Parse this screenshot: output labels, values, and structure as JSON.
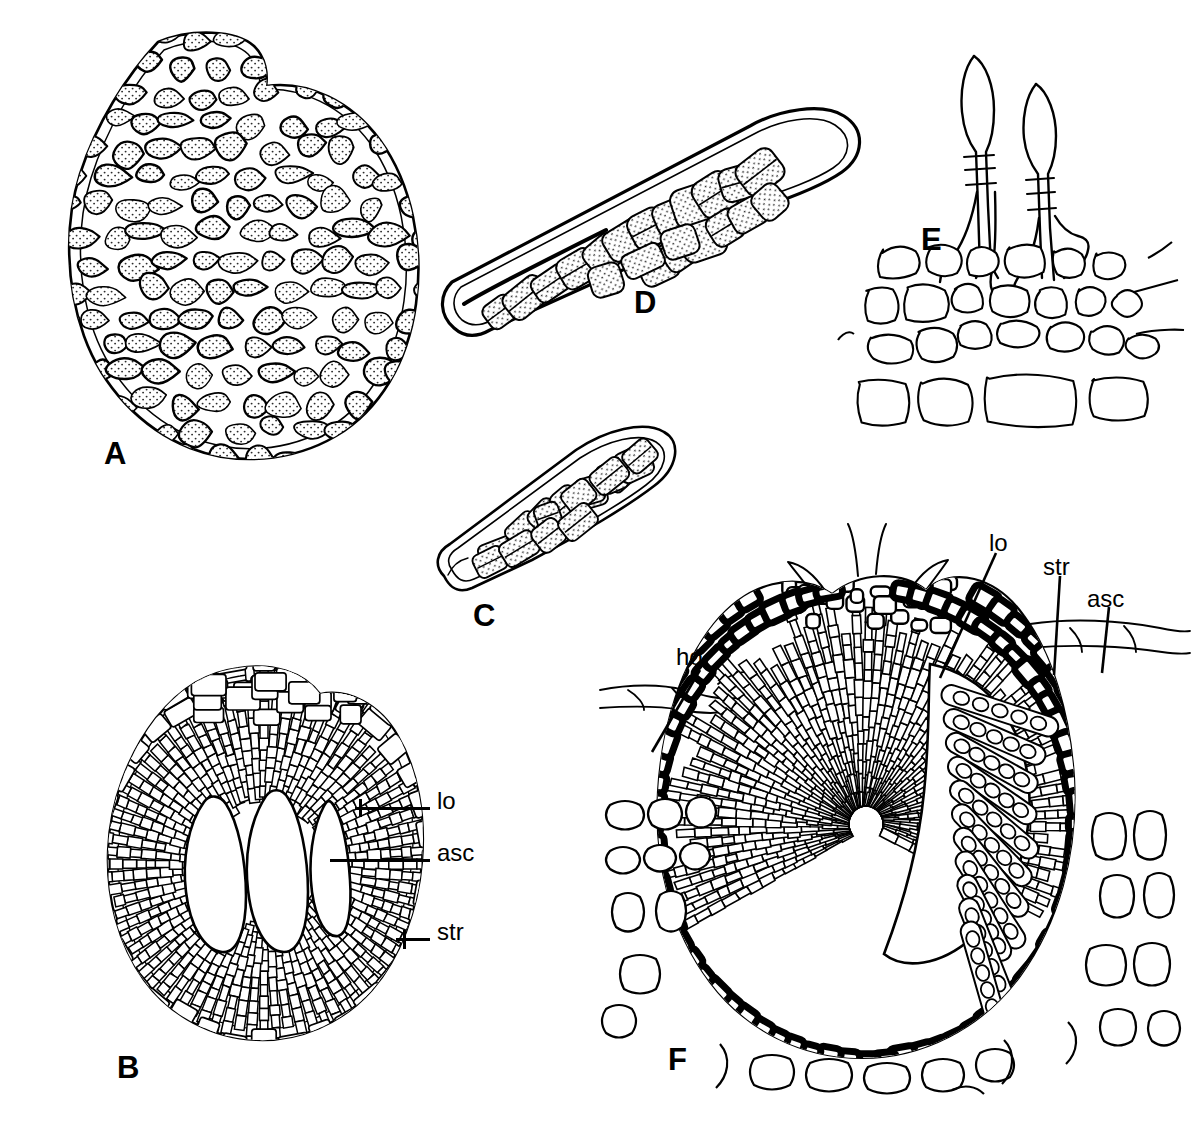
{
  "figure": {
    "kind": "scientific-line-drawing-plate",
    "background_color": "#ffffff",
    "ink_color": "#000000",
    "width": 1198,
    "height": 1132,
    "panel_count": 6
  },
  "panels": [
    {
      "id": "A",
      "letter": "A",
      "description": "Surface view of ascoma showing stippled pseudoparenchymatous cells forming an ovoid body with a papillate apex",
      "letter_x": 104,
      "letter_y": 438,
      "labels": []
    },
    {
      "id": "B",
      "letter": "B",
      "description": "Vertical section of ascostroma with three locules surrounded by radiating pseudoparenchyma",
      "letter_x": 117,
      "letter_y": 1052,
      "labels": [
        "lo",
        "asc",
        "str"
      ]
    },
    {
      "id": "C",
      "letter": "C",
      "description": "Clavate ascus containing overlapping multiseptate ascospores",
      "letter_x": 473,
      "letter_y": 600,
      "labels": []
    },
    {
      "id": "D",
      "letter": "D",
      "description": "Elongate cylindric-clavate ascus with biseriate muriform ascospores",
      "letter_x": 634,
      "letter_y": 287,
      "labels": []
    },
    {
      "id": "E",
      "letter": "E",
      "description": "Two septate conidiophores arising from a pseudoparenchymatous cell layer",
      "letter_x": 921,
      "letter_y": 224,
      "labels": []
    },
    {
      "id": "F",
      "letter": "F",
      "description": "Vertical section through immersed ascoma in host tissue, showing melanized stroma, locule and asci",
      "letter_x": 668,
      "letter_y": 1044,
      "labels": [
        "ho",
        "lo",
        "str",
        "asc"
      ]
    }
  ],
  "callouts": {
    "panel_b": [
      {
        "text": "lo",
        "text_x": 437,
        "text_y": 789,
        "leader_x": 355,
        "leader_y": 807,
        "leader_w": 75,
        "tick": true
      },
      {
        "text": "asc",
        "text_x": 437,
        "text_y": 841,
        "leader_x": 330,
        "leader_y": 859,
        "leader_w": 100,
        "tick": false
      },
      {
        "text": "str",
        "text_x": 437,
        "text_y": 920,
        "leader_x": 400,
        "leader_y": 938,
        "leader_w": 38,
        "tick": true
      }
    ],
    "panel_f": [
      {
        "text": "ho",
        "text_x": 676,
        "text_y": 645,
        "tilt_x1": 652,
        "tilt_y1": 752,
        "tilt_x2": 700,
        "tilt_y2": 670,
        "tick": true
      },
      {
        "text": "lo",
        "text_x": 989,
        "text_y": 531,
        "tilt_x1": 940,
        "tilt_y1": 678,
        "tilt_x2": 996,
        "tilt_y2": 553,
        "tick": false
      },
      {
        "text": "str",
        "text_x": 1043,
        "text_y": 555,
        "tilt_x1": 1054,
        "tilt_y1": 675,
        "tilt_x2": 1058,
        "tilt_y2": 577,
        "tick": false
      },
      {
        "text": "asc",
        "text_x": 1087,
        "text_y": 587,
        "tilt_x1": 1102,
        "tilt_y1": 672,
        "tilt_x2": 1108,
        "tilt_y2": 610,
        "tick": false
      }
    ]
  },
  "legend_terms": [
    {
      "abbrev": "lo",
      "meaning": "locule"
    },
    {
      "abbrev": "asc",
      "meaning": "ascus"
    },
    {
      "abbrev": "str",
      "meaning": "stroma"
    },
    {
      "abbrev": "ho",
      "meaning": "host tissue"
    }
  ]
}
